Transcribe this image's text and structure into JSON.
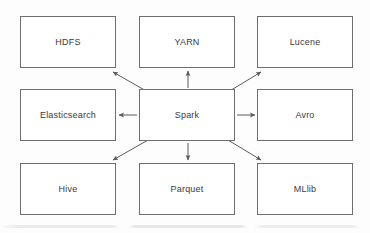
{
  "diagram": {
    "type": "hub-and-spoke",
    "center_node": "Spark",
    "style": {
      "background_color": "#fdfdfd",
      "box_fill_color": "#ffffff",
      "box_stroke_color": "#6e6e6e",
      "text_color": "#3a3a3a",
      "edge_color": "#5a5a5a"
    },
    "nodes": [
      {
        "id": "hdfs",
        "label": "HDFS",
        "x": 20,
        "y": 16,
        "w": 96,
        "h": 52
      },
      {
        "id": "yarn",
        "label": "YARN",
        "x": 139,
        "y": 16,
        "w": 96,
        "h": 52
      },
      {
        "id": "lucene",
        "label": "Lucene",
        "x": 257,
        "y": 16,
        "w": 96,
        "h": 52
      },
      {
        "id": "elasticsearch",
        "label": "Elasticsearch",
        "x": 20,
        "y": 89,
        "w": 96,
        "h": 52
      },
      {
        "id": "spark",
        "label": "Spark",
        "x": 139,
        "y": 89,
        "w": 96,
        "h": 52
      },
      {
        "id": "avro",
        "label": "Avro",
        "x": 257,
        "y": 89,
        "w": 96,
        "h": 52
      },
      {
        "id": "hive",
        "label": "Hive",
        "x": 20,
        "y": 163,
        "w": 96,
        "h": 52
      },
      {
        "id": "parquet",
        "label": "Parquet",
        "x": 139,
        "y": 163,
        "w": 96,
        "h": 52
      },
      {
        "id": "mllib",
        "label": "MLlib",
        "x": 257,
        "y": 163,
        "w": 96,
        "h": 52
      }
    ],
    "edges": [
      {
        "id": "spark-to-hdfs",
        "from": "spark",
        "to": "hdfs",
        "direction": "one-way",
        "x1": 148,
        "y1": 92,
        "x2": 113,
        "y2": 72
      },
      {
        "id": "spark-to-yarn",
        "from": "spark",
        "to": "yarn",
        "direction": "one-way",
        "x1": 188,
        "y1": 88,
        "x2": 188,
        "y2": 71
      },
      {
        "id": "spark-to-lucene",
        "from": "spark",
        "to": "lucene",
        "direction": "one-way",
        "x1": 228,
        "y1": 92,
        "x2": 261,
        "y2": 72
      },
      {
        "id": "spark-to-elasticsearch",
        "from": "spark",
        "to": "elasticsearch",
        "direction": "one-way",
        "x1": 137,
        "y1": 115,
        "x2": 119,
        "y2": 115
      },
      {
        "id": "spark-to-avro",
        "from": "spark",
        "to": "avro",
        "direction": "one-way",
        "x1": 237,
        "y1": 115,
        "x2": 255,
        "y2": 115
      },
      {
        "id": "spark-to-hive",
        "from": "spark",
        "to": "hive",
        "direction": "one-way",
        "x1": 148,
        "y1": 140,
        "x2": 113,
        "y2": 160
      },
      {
        "id": "spark-to-parquet",
        "from": "spark",
        "to": "parquet",
        "direction": "one-way",
        "x1": 188,
        "y1": 143,
        "x2": 188,
        "y2": 160
      },
      {
        "id": "spark-to-mllib",
        "from": "spark",
        "to": "mllib",
        "direction": "one-way",
        "x1": 228,
        "y1": 140,
        "x2": 261,
        "y2": 160
      }
    ]
  }
}
